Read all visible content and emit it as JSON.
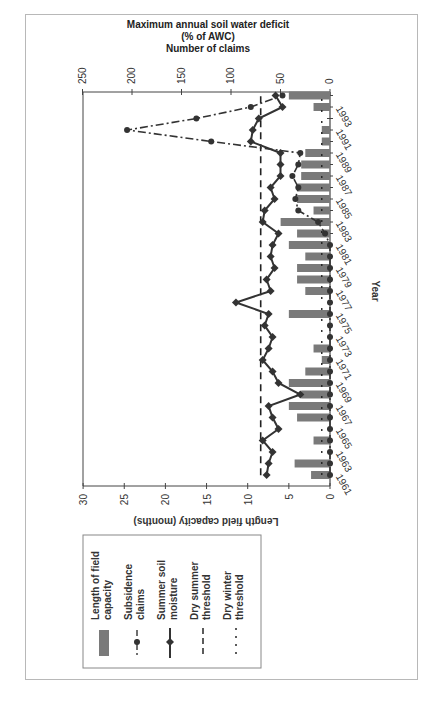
{
  "chart_data": {
    "type": "bar+line",
    "orientation": "rotated-90-ccw",
    "title_lines": [
      "Maximum annual soil water deficit",
      "(% of AWC)",
      "Number of claims"
    ],
    "xlabel": "Year",
    "ylabel_left": "Length field capacity (months)",
    "ylabel_right": "Maximum annual soil water deficit (% of AWC) / Number of claims",
    "years": [
      1961,
      1962,
      1963,
      1964,
      1965,
      1966,
      1967,
      1968,
      1969,
      1970,
      1971,
      1972,
      1973,
      1974,
      1975,
      1976,
      1977,
      1978,
      1979,
      1980,
      1981,
      1982,
      1983,
      1984,
      1985,
      1986,
      1987,
      1988,
      1989,
      1990,
      1991,
      1992,
      1993,
      1994
    ],
    "year_tick_labels": [
      "1961",
      "1963",
      "1965",
      "1967",
      "1969",
      "1971",
      "1973",
      "1975",
      "1977",
      "1979",
      "1981",
      "1983",
      "1985",
      "1987",
      "1989",
      "1991",
      "1993"
    ],
    "months_axis": {
      "ticks": [
        0,
        5,
        10,
        15,
        20,
        25,
        30
      ],
      "range": [
        0,
        30
      ]
    },
    "secondary_axis": {
      "ticks": [
        0,
        50,
        100,
        150,
        200,
        250
      ],
      "range": [
        0,
        250
      ]
    },
    "series": [
      {
        "name": "Length of field capacity",
        "type": "bar",
        "axis": "months",
        "values": [
          2.3,
          4.3,
          0,
          2,
          0,
          4,
          5,
          3.5,
          5,
          3,
          1,
          2,
          0,
          0,
          5,
          0,
          3,
          4,
          4,
          3,
          5,
          4,
          6,
          2,
          4,
          4,
          3.5,
          3.5,
          3,
          1,
          1,
          0,
          2,
          5
        ]
      },
      {
        "name": "Subsidence claims",
        "type": "line-dashdot-circle",
        "axis": "secondary",
        "values": [
          0,
          0,
          0,
          0,
          0,
          0,
          0,
          0,
          0,
          0,
          0,
          0,
          0,
          0,
          0,
          0,
          0,
          0,
          0,
          0,
          0,
          5,
          12,
          32,
          35,
          32,
          38,
          32,
          30,
          120,
          205,
          135,
          80,
          48
        ]
      },
      {
        "name": "Summer soil moisture",
        "type": "line-diamond",
        "axis": "secondary",
        "values": [
          64,
          62,
          58,
          68,
          52,
          58,
          62,
          30,
          52,
          58,
          68,
          62,
          58,
          66,
          62,
          95,
          60,
          64,
          56,
          60,
          58,
          52,
          68,
          66,
          56,
          60,
          50,
          50,
          50,
          80,
          78,
          72,
          48,
          55
        ]
      },
      {
        "name": "Dry summer threshold",
        "type": "hline-dashed",
        "axis": "secondary",
        "value": 70
      },
      {
        "name": "Dry winter threshold",
        "type": "hline-dotted",
        "axis": "months",
        "value": 1
      }
    ],
    "legend_position": "bottom-left (rotated)",
    "grid": false
  },
  "legend": {
    "items": [
      {
        "label_line1": "Length of field",
        "label_line2": "capacity"
      },
      {
        "label_line1": "Subsidence",
        "label_line2": "claims"
      },
      {
        "label_line1": "Summer soil",
        "label_line2": "moisture"
      },
      {
        "label_line1": "Dry summer",
        "label_line2": "threshold"
      },
      {
        "label_line1": "Dry winter",
        "label_line2": "threshold"
      }
    ]
  },
  "colors": {
    "bar": "#7a7a7a",
    "line": "#333333",
    "axis": "#444444",
    "frame": "#b8b8b8"
  }
}
